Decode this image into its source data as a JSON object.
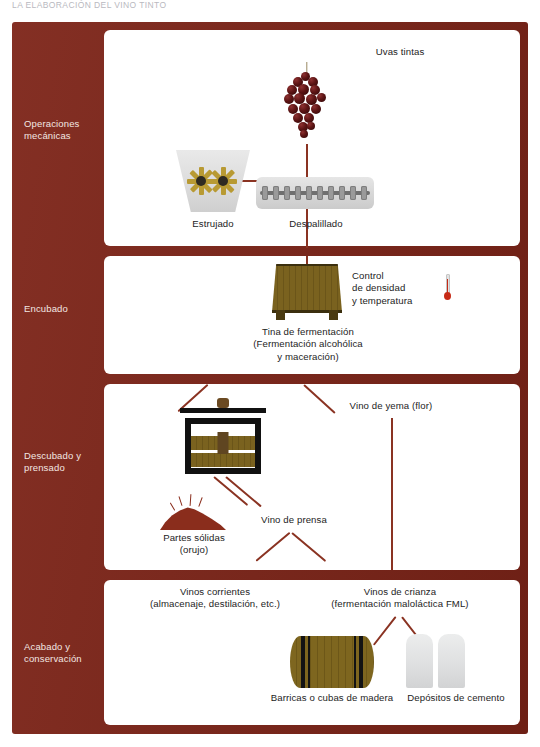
{
  "document": {
    "header_text": "LA ELABORACIÓN DEL VINO TINTO"
  },
  "frame": {
    "accent_color": "#7d2418",
    "panel_background": "#ffffff"
  },
  "stages": [
    {
      "id": "operaciones-mecanicas",
      "label": "Operaciones\nmecánicas"
    },
    {
      "id": "encubado",
      "label": "Encubado"
    },
    {
      "id": "descubado-y-prensado",
      "label": "Descubado\ny prensado"
    },
    {
      "id": "acabado-y-conservacion",
      "label": "Acabado\ny conservación"
    }
  ],
  "panel1": {
    "grapes_label": "Uvas tintas",
    "crusher_label": "Estrujado",
    "destemmer_label": "Despalillado"
  },
  "panel2": {
    "vat_label": "Tina de fermentación\n(Fermentación alcohólica\ny maceración)",
    "control_label": "Control\nde densidad\ny temperatura",
    "thermometer_icon": "thermometer-icon"
  },
  "panel3": {
    "free_run_label": "Vino de yema (flor)",
    "pomace_label": "Partes sólidas\n(orujo)",
    "press_wine_label": "Vino de prensa"
  },
  "panel4": {
    "common_wines_label": "Vinos corrientes\n(almacenaje, destilación, etc.)",
    "aged_wines_label": "Vinos de crianza\n(fermentación maloláctica FML)",
    "barrels_label": "Barricas o cubas de madera",
    "cement_label": "Depósitos de cemento"
  }
}
